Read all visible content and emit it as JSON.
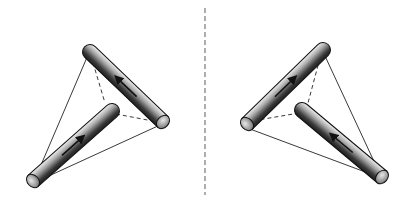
{
  "figure": {
    "colors": {
      "background": "#ffffff",
      "rod_dark": "#2a2a2a",
      "rod_mid": "#8a8a8a",
      "rod_light": "#e6e6e6",
      "outline": "#111111",
      "line": "#222222",
      "divider": "#777777"
    },
    "divider": {
      "x": 205,
      "y1": 8,
      "y2": 195,
      "style": "dashed"
    },
    "left": {
      "rods": [
        {
          "id": "left-top-rod",
          "start": [
            90,
            52
          ],
          "end": [
            163,
            122
          ],
          "cap_at": "end",
          "arrow": "toward-start"
        },
        {
          "id": "left-bottom-rod",
          "start": [
            33,
            181
          ],
          "end": [
            112,
            111
          ],
          "cap_at": "start",
          "arrow": "toward-end"
        }
      ],
      "solid_lines": [
        [
          [
            88,
            55
          ],
          [
            38,
            172
          ]
        ],
        [
          [
            160,
            125
          ],
          [
            40,
            180
          ]
        ]
      ],
      "dashed_lines": [
        [
          [
            91,
            56
          ],
          [
            105,
            103
          ]
        ],
        [
          [
            116,
            114
          ],
          [
            158,
            122
          ]
        ]
      ]
    },
    "right": {
      "rods": [
        {
          "id": "right-top-rod",
          "start": [
            247,
            124
          ],
          "end": [
            323,
            50
          ],
          "cap_at": "start",
          "arrow": "toward-end"
        },
        {
          "id": "right-bottom-rod",
          "start": [
            302,
            110
          ],
          "end": [
            382,
            177
          ],
          "cap_at": "end",
          "arrow": "toward-start"
        }
      ],
      "solid_lines": [
        [
          [
            325,
            56
          ],
          [
            378,
            170
          ]
        ],
        [
          [
            250,
            129
          ],
          [
            376,
            176
          ]
        ]
      ],
      "dashed_lines": [
        [
          [
            320,
            58
          ],
          [
            308,
            103
          ]
        ],
        [
          [
            299,
            113
          ],
          [
            252,
            121
          ]
        ]
      ]
    }
  }
}
